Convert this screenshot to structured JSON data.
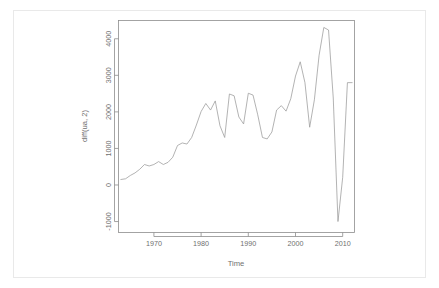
{
  "chart_data": {
    "type": "line",
    "title": "",
    "subtitle": "",
    "xlabel": "Time",
    "ylabel": "diff(ua, 2)",
    "xlim": [
      1962.5,
      2012.5
    ],
    "ylim": [
      -1300,
      4500
    ],
    "xticks": [
      1970,
      1980,
      1990,
      2000,
      2010
    ],
    "yticks": [
      -1000,
      0,
      1000,
      2000,
      3000,
      4000
    ],
    "xtick_labels": [
      "1970",
      "1980",
      "1990",
      "2000",
      "2010"
    ],
    "ytick_labels": [
      "-1000",
      "0",
      "1000",
      "2000",
      "3000",
      "4000"
    ],
    "grid": false,
    "legend": "none",
    "series": [
      {
        "name": "diff(ua, 2)",
        "color": "#9a9a9a",
        "x": [
          1963,
          1964,
          1965,
          1966,
          1967,
          1968,
          1969,
          1970,
          1971,
          1972,
          1973,
          1974,
          1975,
          1976,
          1977,
          1978,
          1979,
          1980,
          1981,
          1982,
          1983,
          1984,
          1985,
          1986,
          1987,
          1988,
          1989,
          1990,
          1991,
          1992,
          1993,
          1994,
          1995,
          1996,
          1997,
          1998,
          1999,
          2000,
          2001,
          2002,
          2003,
          2004,
          2005,
          2006,
          2007,
          2008,
          2009,
          2010,
          2011,
          2012
        ],
        "y": [
          150,
          170,
          260,
          330,
          430,
          560,
          520,
          560,
          640,
          560,
          620,
          760,
          1080,
          1150,
          1120,
          1300,
          1640,
          2010,
          2230,
          2050,
          2300,
          1620,
          1300,
          2490,
          2440,
          1860,
          1670,
          2510,
          2460,
          1920,
          1300,
          1260,
          1450,
          2050,
          2170,
          2020,
          2360,
          2980,
          3370,
          2800,
          1580,
          2330,
          3550,
          4310,
          4240,
          2380,
          -1000,
          210,
          2800,
          2800
        ]
      }
    ]
  },
  "figure": {
    "background_color": "#ffffff",
    "foreground_color": "#8d8d8d",
    "line_color": "#9a9a9a",
    "border_color": "#e9e9e9"
  }
}
